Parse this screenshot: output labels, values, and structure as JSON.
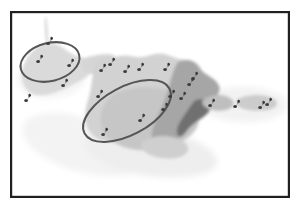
{
  "figure": {
    "kind": "map-figure",
    "caption": "",
    "background_color": "#ffffff",
    "frame": {
      "stroke_color": "#231f20",
      "stroke_width": 2.2,
      "x": 10,
      "y": 11,
      "width": 280,
      "height": 187
    }
  },
  "palette": {
    "paper": "#ffffff",
    "haze_light": "#f1f1f1",
    "haze_mid": "#e8e8e8",
    "land_light": "#d8d8d8",
    "land_mid": "#c9c9c9",
    "land_dark": "#a8a8a8",
    "land_darkest": "#6f6f6f",
    "ellipse_stroke": "#555555",
    "marker_fill": "#3b3b3b",
    "frame_stroke": "#231f20"
  },
  "map": {
    "name": "grayscale-region-map",
    "layers": [
      {
        "id": "haze-south-west",
        "label": "light-haze-southwest",
        "fill": "#f4f4f4"
      },
      {
        "id": "haze-south",
        "label": "light-haze-south",
        "fill": "#efefef"
      },
      {
        "id": "haze-east",
        "label": "light-haze-east",
        "fill": "#f2f2f2"
      },
      {
        "id": "land-west",
        "label": "western-landmass-light",
        "fill": "#dcdcdc"
      },
      {
        "id": "land-main-light",
        "label": "main-landmass-light",
        "fill": "#d3d3d3"
      },
      {
        "id": "land-main-mid",
        "label": "main-landmass-mid",
        "fill": "#c4c4c4"
      },
      {
        "id": "land-east-dark",
        "label": "eastern-landmass-dark",
        "fill": "#a4a4a4"
      },
      {
        "id": "land-spur-darkest",
        "label": "eastern-spur-darkest",
        "fill": "#6f6f6f"
      },
      {
        "id": "spike-north",
        "label": "northern-spike",
        "fill": "#dddddd"
      }
    ]
  },
  "annotations": {
    "ellipses": [
      {
        "id": "ellipse-west",
        "label": "western-cluster-ellipse",
        "cx": 50,
        "cy": 62,
        "rx": 30,
        "ry": 19,
        "rotation": -14,
        "stroke": "#555555",
        "stroke_width": 2.0,
        "enclosed_marker_count": 2
      },
      {
        "id": "ellipse-central",
        "label": "central-cluster-ellipse",
        "cx": 127,
        "cy": 111,
        "rx": 48,
        "ry": 24,
        "rotation": -28,
        "stroke": "#555555",
        "stroke_width": 2.0,
        "enclosed_marker_count": 4
      }
    ]
  },
  "markers": {
    "glyph": "site-marker",
    "fill": "#3b3b3b",
    "total_count": 22,
    "points": [
      {
        "id": "m01",
        "x": 49,
        "y": 43,
        "label": "marker-north-spike-base"
      },
      {
        "id": "m02",
        "x": 39,
        "y": 61,
        "label": "marker-west-inner-a"
      },
      {
        "id": "m03",
        "x": 70,
        "y": 65,
        "label": "marker-west-inner-b"
      },
      {
        "id": "m04",
        "x": 64,
        "y": 85,
        "label": "marker-west-edge-south"
      },
      {
        "id": "m05",
        "x": 27,
        "y": 100,
        "label": "marker-west-outer"
      },
      {
        "id": "m06",
        "x": 102,
        "y": 70,
        "label": "marker-north-row-a"
      },
      {
        "id": "m07",
        "x": 111,
        "y": 64,
        "label": "marker-north-row-b"
      },
      {
        "id": "m08",
        "x": 126,
        "y": 71,
        "label": "marker-north-row-c"
      },
      {
        "id": "m09",
        "x": 140,
        "y": 69,
        "label": "marker-north-row-d"
      },
      {
        "id": "m10",
        "x": 166,
        "y": 69,
        "label": "marker-north-row-e"
      },
      {
        "id": "m11",
        "x": 194,
        "y": 78,
        "label": "marker-northeast"
      },
      {
        "id": "m12",
        "x": 99,
        "y": 96,
        "label": "marker-central-outer-west"
      },
      {
        "id": "m13",
        "x": 171,
        "y": 96,
        "label": "marker-central-inner-east"
      },
      {
        "id": "m14",
        "x": 182,
        "y": 98,
        "label": "marker-east-of-ellipse"
      },
      {
        "id": "m15",
        "x": 164,
        "y": 109,
        "label": "marker-central-inner-southeast"
      },
      {
        "id": "m16",
        "x": 141,
        "y": 120,
        "label": "marker-central-inner-mid"
      },
      {
        "id": "m17",
        "x": 104,
        "y": 134,
        "label": "marker-central-inner-southwest"
      },
      {
        "id": "m18",
        "x": 211,
        "y": 105,
        "label": "marker-east-a"
      },
      {
        "id": "m19",
        "x": 236,
        "y": 106,
        "label": "marker-east-b"
      },
      {
        "id": "m20",
        "x": 261,
        "y": 107,
        "label": "marker-far-east-a"
      },
      {
        "id": "m21",
        "x": 268,
        "y": 104,
        "label": "marker-far-east-b"
      },
      {
        "id": "m22",
        "x": 190,
        "y": 84,
        "label": "marker-northeast-lower"
      }
    ]
  }
}
